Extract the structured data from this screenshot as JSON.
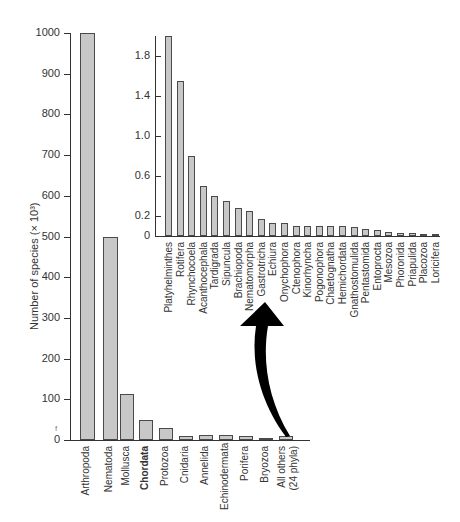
{
  "chart_data": [
    {
      "type": "bar",
      "title": "",
      "xlabel": "",
      "ylabel": "Number of species (× 10³)",
      "ylim": [
        0,
        1000
      ],
      "yticks": [
        0,
        100,
        200,
        300,
        400,
        500,
        600,
        700,
        800,
        900,
        1000
      ],
      "grid": false,
      "categories": [
        "Arthropoda",
        "Nematoda",
        "Mollusca",
        "Chordata",
        "Protozoa",
        "Cnidaria",
        "Annelida",
        "Echinodermata",
        "Porifera",
        "Bryozoa",
        "All others (24 phyla)"
      ],
      "values": [
        1000,
        500,
        113,
        50,
        30,
        11,
        12,
        12,
        10,
        5,
        10
      ],
      "highlight": "Chordata"
    },
    {
      "type": "bar",
      "title": "Inset: All others (24 phyla)",
      "xlabel": "",
      "ylabel": "",
      "ylim": [
        0,
        2.0
      ],
      "yticks": [
        0,
        0.2,
        0.6,
        1.0,
        1.4,
        1.8
      ],
      "grid": false,
      "categories": [
        "Platyhelminthes",
        "Rotifera",
        "Rhynchocoela",
        "Acanthocephala",
        "Tardigrada",
        "Sipuncula",
        "Brachiopoda",
        "Nematomorpha",
        "Gastrotricha",
        "Echiura",
        "Onychophora",
        "Ctenophora",
        "Kinorhyncha",
        "Pogonophora",
        "Chaetognatha",
        "Hemichordata",
        "Gnathostomulida",
        "Pentastomida",
        "Entoprocta",
        "Mesozoa",
        "Phoronida",
        "Priapulida",
        "Placozoa",
        "Loricifera"
      ],
      "values": [
        2.0,
        1.55,
        0.8,
        0.5,
        0.4,
        0.35,
        0.28,
        0.25,
        0.17,
        0.13,
        0.13,
        0.1,
        0.1,
        0.1,
        0.1,
        0.1,
        0.09,
        0.07,
        0.06,
        0.04,
        0.03,
        0.03,
        0.02,
        0.02
      ]
    }
  ],
  "main": {
    "ylabel": "Number of species (× 10³)",
    "yticks": [
      "0",
      "100",
      "200",
      "300",
      "400",
      "500",
      "600",
      "700",
      "800",
      "900",
      "1000"
    ],
    "categories": [
      "Arthropoda",
      "Nematoda",
      "Mollusca",
      "Chordata",
      "Protozoa",
      "Cnidaria",
      "Annelida",
      "Echinodermata",
      "Porifera",
      "Bryozoa",
      "All others",
      "(24 phyla)"
    ]
  },
  "inset": {
    "yticks": [
      "0",
      "0.2",
      "0.6",
      "1.0",
      "1.4",
      "1.8"
    ],
    "categories": [
      "Platyhelminthes",
      "Rotifera",
      "Rhynchocoela",
      "Acanthocephala",
      "Tardigrada",
      "Sipuncula",
      "Brachiopoda",
      "Nematomorpha",
      "Gastrotricha",
      "Echiura",
      "Onychophora",
      "Ctenophora",
      "Kinorhyncha",
      "Pogonophora",
      "Chaetognatha",
      "Hemichordata",
      "Gnathostomulida",
      "Pentastomida",
      "Entoprocta",
      "Mesozoa",
      "Phoronida",
      "Priapulida",
      "Placozoa",
      "Loricifera"
    ]
  },
  "stray_glyph": "f"
}
